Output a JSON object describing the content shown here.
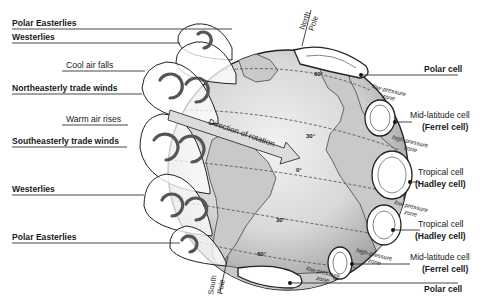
{
  "left_labels": {
    "polar_easterlies_top": "Polar Easterlies",
    "westerlies_top": "Westerlies",
    "cool_air_falls": "Cool air falls",
    "northeasterly_trade_winds": "Northeasterly trade winds",
    "warm_air_rises": "Warm air rises",
    "southeasterly_trade_winds": "Southeasterly trade winds",
    "westerlies_bottom": "Westerlies",
    "polar_easterlies_bottom": "Polar Easterlies"
  },
  "globe": {
    "north_pole": [
      "North",
      "Pole"
    ],
    "south_pole": [
      "South",
      "Pole"
    ],
    "direction_of_rotation": "Direction of rotation",
    "latitudes": {
      "n60": "60°",
      "n30": "30°",
      "eq": "0°",
      "s30": "30°",
      "s60": "60°"
    }
  },
  "right_labels": {
    "polar_cell_top": "Polar cell",
    "low_pressure_top": [
      "low-pressure",
      "zone"
    ],
    "mid_lat_top": "Mid-latitude cell",
    "ferrel_top": "(Ferrel cell)",
    "high_pressure_top": [
      "high-pressure",
      "zone"
    ],
    "tropical_top": "Tropical cell",
    "hadley_top": "(Hadley cell)",
    "low_pressure_mid": [
      "low-pressure",
      "zone"
    ],
    "tropical_bottom": "Tropical cell",
    "hadley_bottom": "(Hadley cell)",
    "high_pressure_bottom": [
      "high-pressure",
      "zone"
    ],
    "mid_lat_bottom": "Mid-latitude cell",
    "ferrel_bottom": "(Ferrel cell)",
    "low_pressure_bottom": [
      "low-pressure",
      "zone"
    ],
    "polar_cell_bottom": "Polar cell"
  }
}
